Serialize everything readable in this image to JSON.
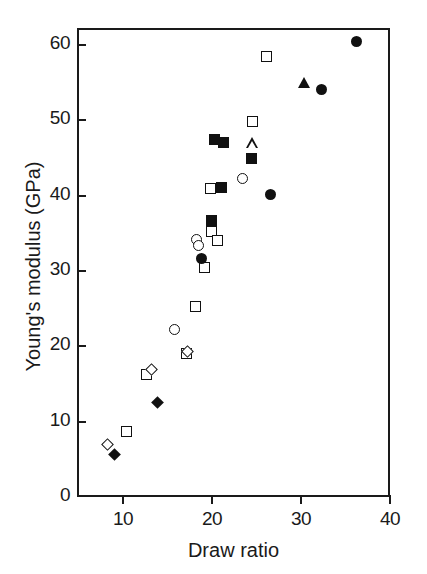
{
  "chart_data": {
    "type": "scatter",
    "title": "",
    "xlabel": "Draw ratio",
    "ylabel": "Young's modulus (GPa)",
    "xlim": [
      3,
      38
    ],
    "ylim": [
      0,
      63
    ],
    "xticks": [
      10,
      20,
      30,
      40
    ],
    "yticks": [
      0,
      10,
      20,
      30,
      40,
      50,
      60
    ],
    "xticklabels": [
      "10",
      "20",
      "30",
      "40"
    ],
    "yticklabels": [
      "0",
      "10",
      "20",
      "30",
      "40",
      "50",
      "60"
    ],
    "grid": false,
    "legend": "none",
    "series": [
      {
        "name": "open-square",
        "marker": "square-open",
        "points": [
          {
            "x": 10.4,
            "y": 8.7
          },
          {
            "x": 12.6,
            "y": 16.2
          },
          {
            "x": 17.1,
            "y": 19.0
          },
          {
            "x": 18.1,
            "y": 25.3
          },
          {
            "x": 19.2,
            "y": 30.4
          },
          {
            "x": 19.9,
            "y": 35.2
          },
          {
            "x": 20.6,
            "y": 34.0
          },
          {
            "x": 19.8,
            "y": 41.0
          },
          {
            "x": 24.6,
            "y": 49.8
          },
          {
            "x": 26.1,
            "y": 58.5
          }
        ]
      },
      {
        "name": "filled-square",
        "marker": "square-filled",
        "points": [
          {
            "x": 19.9,
            "y": 36.7
          },
          {
            "x": 21.1,
            "y": 41.1
          },
          {
            "x": 20.3,
            "y": 47.5
          },
          {
            "x": 21.3,
            "y": 47.0
          },
          {
            "x": 24.4,
            "y": 45.0
          }
        ]
      },
      {
        "name": "open-circle",
        "marker": "circle-open",
        "points": [
          {
            "x": 15.8,
            "y": 22.3
          },
          {
            "x": 18.3,
            "y": 34.2
          },
          {
            "x": 18.5,
            "y": 33.4
          },
          {
            "x": 23.4,
            "y": 42.3
          }
        ]
      },
      {
        "name": "filled-circle",
        "marker": "circle-filled",
        "points": [
          {
            "x": 18.8,
            "y": 31.6
          },
          {
            "x": 26.6,
            "y": 40.2
          },
          {
            "x": 32.3,
            "y": 54.1
          },
          {
            "x": 36.2,
            "y": 60.4
          }
        ]
      },
      {
        "name": "open-diamond",
        "marker": "diamond-open",
        "points": [
          {
            "x": 8.3,
            "y": 7.0
          },
          {
            "x": 13.2,
            "y": 16.9
          },
          {
            "x": 17.3,
            "y": 19.3
          }
        ]
      },
      {
        "name": "filled-diamond",
        "marker": "diamond-filled",
        "points": [
          {
            "x": 9.0,
            "y": 5.7
          },
          {
            "x": 13.9,
            "y": 12.5
          }
        ]
      },
      {
        "name": "open-triangle",
        "marker": "triangle-open",
        "points": [
          {
            "x": 24.5,
            "y": 47.0
          }
        ]
      },
      {
        "name": "filled-triangle",
        "marker": "triangle-filled",
        "points": [
          {
            "x": 30.4,
            "y": 55.0
          }
        ]
      }
    ]
  },
  "axes": {
    "x_label": "Draw ratio",
    "y_label": "Young's modulus (GPa)"
  }
}
